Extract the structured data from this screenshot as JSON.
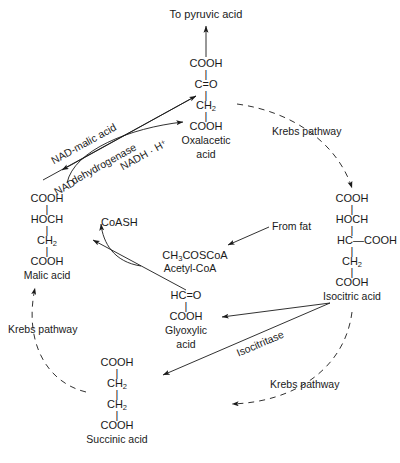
{
  "diagram": {
    "type": "biochemical-pathway",
    "line_color": "#1a1a1a",
    "background": "#ffffff"
  },
  "nodes": {
    "pyruvic_outlet": {
      "label": "To pyruvic acid"
    },
    "oxalacetic": {
      "name": "Oxalacetic\nacid",
      "formula_rows": [
        "COOH",
        "C=O",
        "CH2",
        "COOH"
      ],
      "row1": "COOH",
      "row2": "C=O",
      "row3_pre": "CH",
      "row3_sub": "2",
      "row4": "COOH",
      "name_line1": "Oxalacetic",
      "name_line2": "acid"
    },
    "malic": {
      "name": "Malic acid",
      "formula_rows": [
        "COOH",
        "HOCH",
        "CH2",
        "COOH"
      ],
      "row1": "COOH",
      "row2": "HOCH",
      "row3_pre": "CH",
      "row3_sub": "2",
      "row4": "COOH"
    },
    "isocitric": {
      "name": "Isocitric acid",
      "formula_rows": [
        "COOH",
        "HOCH",
        "HC-COOH",
        "CH2",
        "COOH"
      ],
      "row1": "COOH",
      "row2": "HOCH",
      "row3": "HC—COOH",
      "row4_pre": "CH",
      "row4_sub": "2",
      "row5": "COOH"
    },
    "succinic": {
      "name": "Succinic acid",
      "formula_rows": [
        "COOH",
        "CH2",
        "CH2",
        "COOH"
      ],
      "row1": "COOH",
      "row2_pre": "CH",
      "row2_sub": "2",
      "row3_pre": "CH",
      "row3_sub": "2",
      "row4": "COOH"
    },
    "glyoxylic": {
      "name": "Glyoxylic\nacid",
      "formula_rows": [
        "HC=O",
        "COOH"
      ],
      "row1": "HC=O",
      "row2": "COOH",
      "name_line1": "Glyoxylic",
      "name_line2": "acid"
    },
    "acetyl_coa": {
      "formula_pre": "CH",
      "formula_sub": "3",
      "formula_post": "COSCoA",
      "name": "Acetyl-CoA"
    },
    "coash": {
      "label": "CoASH"
    },
    "from_fat": {
      "label": "From fat"
    }
  },
  "enzymes": {
    "malic_dehydrogenase_line1": "NAD-malic acid",
    "malic_dehydrogenase_line2": "dehydrogenase",
    "isocitritase": "Isocitritase"
  },
  "cofactors": {
    "nad": "NAD",
    "nadh_pre": "NADH · H",
    "nadh_sup": "+"
  },
  "pathway_labels": {
    "krebs_top_right": "Krebs pathway",
    "krebs_left": "Krebs pathway",
    "krebs_bottom_right": "Krebs pathway"
  }
}
